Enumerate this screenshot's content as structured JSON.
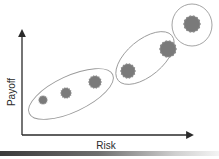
{
  "diagram": {
    "axes": {
      "x_label": "Risk",
      "y_label": "Payoff",
      "color": "#2a2a2a"
    },
    "groups": [
      {
        "name": "low",
        "cx": 71,
        "cy": 94,
        "rx": 46,
        "ry": 18,
        "rotate": -25
      },
      {
        "name": "medium",
        "cx": 145,
        "cy": 58,
        "rx": 35,
        "ry": 18,
        "rotate": -40
      },
      {
        "name": "high",
        "cx": 192,
        "cy": 25,
        "rx": 20,
        "ry": 21,
        "rotate": 0
      }
    ],
    "points": [
      {
        "cx": 43,
        "cy": 100,
        "r": 4
      },
      {
        "cx": 66,
        "cy": 93,
        "r": 5
      },
      {
        "cx": 95,
        "cy": 82,
        "r": 6
      },
      {
        "cx": 128,
        "cy": 71,
        "r": 7
      },
      {
        "cx": 168,
        "cy": 49,
        "r": 8
      },
      {
        "cx": 192,
        "cy": 24,
        "r": 8
      }
    ],
    "colors": {
      "blob_fill": "#7a7a7a",
      "blob_edge": "#8c8c8c",
      "ellipse_stroke": "#9a9a9a"
    }
  }
}
